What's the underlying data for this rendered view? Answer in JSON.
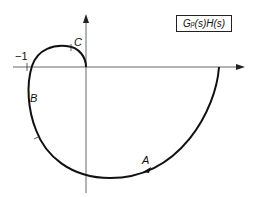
{
  "diagram": {
    "title_box": {
      "G": "G",
      "sub": "p",
      "rest": "(s)H(s)"
    },
    "labels": {
      "minus_one": "−1",
      "point_a": "A",
      "point_b": "B",
      "point_c": "C"
    },
    "axes": {
      "real_axis": "Re",
      "imag_axis": "Im"
    },
    "colors": {
      "curve": "#111111",
      "axis": "#555555"
    }
  }
}
